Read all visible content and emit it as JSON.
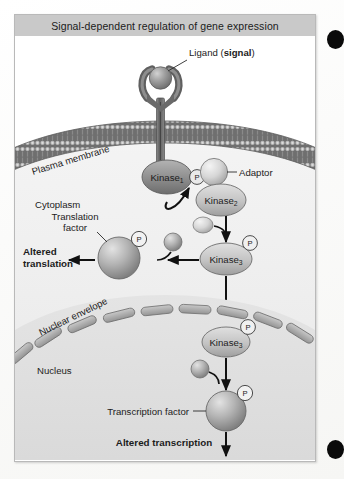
{
  "figure": {
    "title": "Signal-dependent regulation of gene expression",
    "frame_border_color": "#b9b9b9",
    "title_bar_color": "#c9c9c9",
    "background_color": "#ffffff"
  },
  "labels": {
    "ligand": "Ligand (",
    "ligand_bold": "signal",
    "ligand_close": ")",
    "plasma_membrane": "Plasma membrane",
    "cytoplasm": "Cytoplasm",
    "adaptor": "Adaptor",
    "translation_factor_line1": "Translation",
    "translation_factor_line2": "factor",
    "altered_translation_line1": "Altered",
    "altered_translation_line2": "translation",
    "nuclear_envelope": "Nuclear envelope",
    "nucleus": "Nucleus",
    "transcription_factor": "Transcription factor",
    "altered_transcription": "Altered transcription"
  },
  "molecules": {
    "kinase1_name": "Kinase",
    "kinase1_sub": "1",
    "kinase2_name": "Kinase",
    "kinase2_sub": "2",
    "kinase3_cyto_name": "Kinase",
    "kinase3_cyto_sub": "3",
    "kinase3_nuc_name": "Kinase",
    "kinase3_nuc_sub": "3",
    "phosphate_glyph": "P"
  },
  "colors": {
    "membrane_dark": "#6e6e6e",
    "cytoplasm_fill": "#efefef",
    "nucleus_fill": "#e2e2e2",
    "kinase_dark": "#8f8f8f",
    "kinase_light": "#c6c6c6",
    "sphere_gray": "#a8a8a8",
    "arrow_black": "#111111",
    "text_black": "#1c1c1c",
    "edge_dot": "#0a0a0a"
  }
}
